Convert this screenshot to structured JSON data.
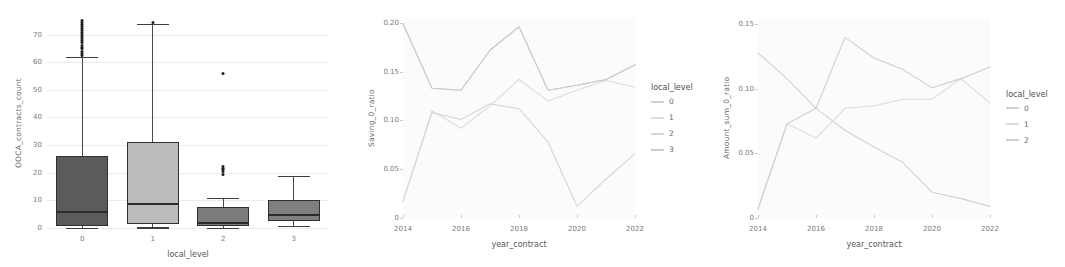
{
  "chart_data": [
    {
      "type": "box",
      "panel_name": "contracts-count-boxplot",
      "title": "",
      "xlabel": "local_level",
      "ylabel": "OOCA_contracts_count",
      "categories": [
        "0",
        "1",
        "2",
        "3"
      ],
      "ylim": [
        0,
        76
      ],
      "yticks": [
        0,
        10,
        20,
        30,
        40,
        50,
        60,
        70
      ],
      "grid": true,
      "boxes": [
        {
          "category": "0",
          "fill": "#5b5b5b",
          "q1": 0.8,
          "median": 6.0,
          "q3": 26.0,
          "whisker_low": 0.0,
          "whisker_high": 62.0,
          "outliers": [
            62.5,
            63.2,
            64.0,
            64.8,
            65.5,
            66.2,
            67.0,
            67.8,
            68.5,
            69.2,
            70.0,
            70.8,
            71.5,
            72.2,
            73.0,
            73.8,
            74.5,
            75.0
          ]
        },
        {
          "category": "1",
          "fill": "#bcbcbc",
          "q1": 1.6,
          "median": 9.0,
          "q3": 31.0,
          "whisker_low": 0.2,
          "whisker_high": 74.0,
          "outliers": [
            74.5
          ]
        },
        {
          "category": "2",
          "fill": "#7b7b7b",
          "q1": 0.6,
          "median": 2.0,
          "q3": 7.6,
          "whisker_low": 0.0,
          "whisker_high": 11.0,
          "outliers": [
            19.5,
            20.3,
            21.0,
            21.7,
            22.3,
            55.8
          ]
        },
        {
          "category": "3",
          "fill": "#7f7f7f",
          "q1": 2.6,
          "median": 5.0,
          "q3": 10.2,
          "whisker_low": 0.7,
          "whisker_high": 19.0,
          "outliers": []
        }
      ]
    },
    {
      "type": "line",
      "panel_name": "saving-ratio-lineplot",
      "title": "",
      "xlabel": "year_contract",
      "ylabel": "Saving_0_ratio",
      "x": [
        2014,
        2015,
        2016,
        2017,
        2018,
        2019,
        2020,
        2021,
        2022
      ],
      "xticks": [
        "2014",
        "2016",
        "2018",
        "2020",
        "2022"
      ],
      "ylim": [
        0,
        0.205
      ],
      "yticks": [
        "0",
        "0.05",
        "0.10",
        "0.15",
        "0.20"
      ],
      "ytick_values": [
        0,
        0.05,
        0.1,
        0.15,
        0.2
      ],
      "grid": true,
      "legend": {
        "title": "local_level",
        "position": "right",
        "entries": [
          "0",
          "1",
          "2",
          "3"
        ]
      },
      "series": [
        {
          "name": "0",
          "color": "#d2d2d2",
          "values": [
            0.199,
            0.133,
            0.131,
            0.172,
            0.196,
            0.131,
            0.136,
            0.142,
            0.157
          ]
        },
        {
          "name": "1",
          "color": "#dcdcdc",
          "values": [
            0.017,
            0.11,
            0.092,
            0.115,
            0.142,
            0.12,
            0.131,
            0.141,
            0.134
          ]
        },
        {
          "name": "2",
          "color": "#d6d6d6",
          "values": [
            0.017,
            0.108,
            0.101,
            0.117,
            0.112,
            0.078,
            0.012,
            0.04,
            0.066
          ]
        },
        {
          "name": "3",
          "color": "#cbcbcb",
          "values": [
            0.199,
            0.133,
            0.131,
            0.172,
            0.196,
            0.131,
            0.136,
            0.142,
            0.157
          ]
        }
      ]
    },
    {
      "type": "line",
      "panel_name": "amount-sum-ratio-lineplot",
      "title": "",
      "xlabel": "year_contract",
      "ylabel": "Amount_sum_0_ratio",
      "x": [
        2014,
        2015,
        2016,
        2017,
        2018,
        2019,
        2020,
        2021,
        2022
      ],
      "xticks": [
        "2014",
        "2016",
        "2018",
        "2020",
        "2022"
      ],
      "ylim": [
        0,
        0.155
      ],
      "yticks": [
        "0",
        "0.05",
        "0.10",
        "0.15"
      ],
      "ytick_values": [
        0,
        0.05,
        0.1,
        0.15
      ],
      "grid": true,
      "legend": {
        "title": "local_level",
        "position": "right",
        "entries": [
          "0",
          "1",
          "2"
        ]
      },
      "series": [
        {
          "name": "0",
          "color": "#d2d2d2",
          "values": [
            0.128,
            0.108,
            0.085,
            0.068,
            0.055,
            0.043,
            0.02,
            0.015,
            0.009
          ]
        },
        {
          "name": "1",
          "color": "#dcdcdc",
          "values": [
            0.007,
            0.073,
            0.062,
            0.085,
            0.087,
            0.092,
            0.092,
            0.108,
            0.089
          ]
        },
        {
          "name": "2",
          "color": "#cfcfcf",
          "values": [
            0.007,
            0.073,
            0.085,
            0.14,
            0.124,
            0.115,
            0.101,
            0.108,
            0.117
          ]
        }
      ]
    }
  ]
}
